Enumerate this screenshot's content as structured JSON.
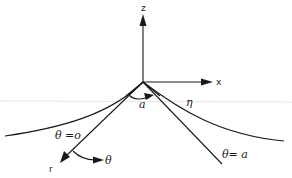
{
  "diagram": {
    "axes": {
      "z_label": "z",
      "x_label": "x",
      "r_label": "r"
    },
    "angles": {
      "alpha_label": "a",
      "theta_label": "θ",
      "eta_label": "η"
    },
    "boundaries": {
      "theta_zero_label": "θ =o",
      "theta_a_label": "θ= a"
    },
    "colors": {
      "ink": "#1a1a1a",
      "background": "#ffffff",
      "reference_line": "#e6e6e6"
    }
  }
}
